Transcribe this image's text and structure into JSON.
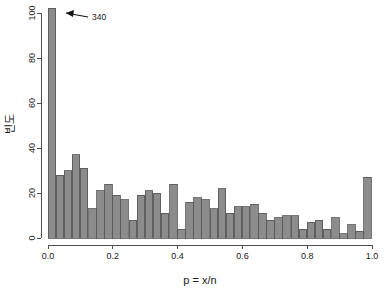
{
  "chart_data": {
    "type": "bar",
    "title": "",
    "subtitle": "",
    "xlabel": "p = x/n",
    "ylabel": "빈도",
    "xlim": [
      0.0,
      1.0
    ],
    "ylim": [
      0,
      105
    ],
    "grid": false,
    "legend": null,
    "bin_width": 0.025,
    "bar_fill": "#8c8c8c",
    "bar_stroke": "#545454",
    "axis_color": "#4d4d4d",
    "text_color": "#1a1a1a",
    "xticks": [
      0.0,
      0.2,
      0.4,
      0.6,
      0.8,
      1.0
    ],
    "xtick_labels": [
      "0.0",
      "0.2",
      "0.4",
      "0.6",
      "0.8",
      "1.0"
    ],
    "yticks": [
      0,
      20,
      40,
      60,
      80,
      100
    ],
    "ytick_labels": [
      "0",
      "20",
      "40",
      "60",
      "80",
      "100"
    ],
    "categories": [
      "0.000",
      "0.025",
      "0.050",
      "0.075",
      "0.100",
      "0.125",
      "0.150",
      "0.175",
      "0.200",
      "0.225",
      "0.250",
      "0.275",
      "0.300",
      "0.325",
      "0.350",
      "0.375",
      "0.400",
      "0.425",
      "0.450",
      "0.475",
      "0.500",
      "0.525",
      "0.550",
      "0.575",
      "0.600",
      "0.625",
      "0.650",
      "0.675",
      "0.700",
      "0.725",
      "0.750",
      "0.775",
      "0.800",
      "0.825",
      "0.850",
      "0.875",
      "0.900",
      "0.925",
      "0.950",
      "0.975"
    ],
    "values": [
      104,
      28,
      30,
      37,
      31,
      13,
      21,
      24,
      19,
      17,
      8,
      19,
      21,
      20,
      11,
      24,
      4,
      16,
      18,
      17,
      13,
      22,
      11,
      14,
      14,
      15,
      11,
      8,
      9,
      10,
      10,
      4,
      7,
      8,
      4,
      9,
      2,
      6,
      3,
      27
    ],
    "annotations": [
      {
        "text": "340",
        "target_category": "0.000",
        "target_value": 104,
        "note": "first bar is truncated; true count is 340"
      }
    ]
  }
}
